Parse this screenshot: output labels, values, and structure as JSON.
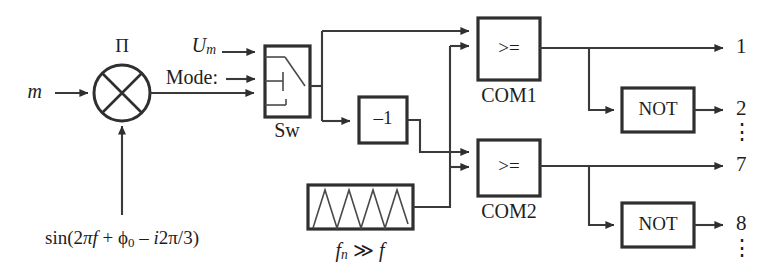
{
  "diagram": {
    "stroke_color": "#2f2f2f",
    "wire_color": "#3a3a3a",
    "background": "#ffffff",
    "inputs": {
      "modulation_signal": "m",
      "carrier_amplitude": "U",
      "carrier_amplitude_sub": "m",
      "mode_label": "Mode:",
      "reference_formula": "sin(2πf + ϕ₀ – i2π/3)"
    },
    "blocks": {
      "multiplier_symbol": "Π",
      "switch_label": "Sw",
      "inverter_label": "–1",
      "comparator1_symbol": ">=",
      "comparator1_label": "COM1",
      "comparator2_symbol": ">=",
      "comparator2_label": "COM2",
      "not1_label": "NOT",
      "not2_label": "NOT",
      "carrier_gen_label": "f",
      "carrier_gen_sub": "n",
      "carrier_gen_rel": "≫",
      "carrier_gen_freq": "f"
    },
    "outputs": [
      {
        "name": "out-1",
        "label": "1"
      },
      {
        "name": "out-2",
        "label": "2"
      },
      {
        "name": "out-7",
        "label": "7"
      },
      {
        "name": "out-8",
        "label": "8"
      }
    ],
    "ellipsis": "⋮"
  }
}
